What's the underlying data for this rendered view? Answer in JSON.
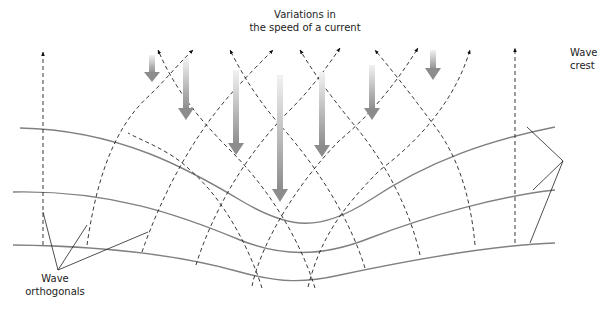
{
  "diagram": {
    "title": "Variations in the speed of a current",
    "title_line1": "Variations in",
    "title_line2": "the speed of a current",
    "labels": {
      "wave_orthogonals_line1": "Wave",
      "wave_orthogonals_line2": "orthogonals",
      "wave_crest_line1": "Wave",
      "wave_crest_line2": "crest"
    },
    "colors": {
      "crest_line": "#808080",
      "orthogonal_line": "#222222",
      "current_arrow_top": "#f2f2f2",
      "current_arrow_bottom": "#8c8c8c"
    },
    "current_arrows": [
      {
        "x": 152,
        "y1": 55,
        "y2": 82
      },
      {
        "x": 186,
        "y1": 58,
        "y2": 120
      },
      {
        "x": 236,
        "y1": 70,
        "y2": 155
      },
      {
        "x": 280,
        "y1": 75,
        "y2": 202
      },
      {
        "x": 322,
        "y1": 72,
        "y2": 157
      },
      {
        "x": 372,
        "y1": 65,
        "y2": 120
      },
      {
        "x": 433,
        "y1": 50,
        "y2": 80
      }
    ]
  }
}
